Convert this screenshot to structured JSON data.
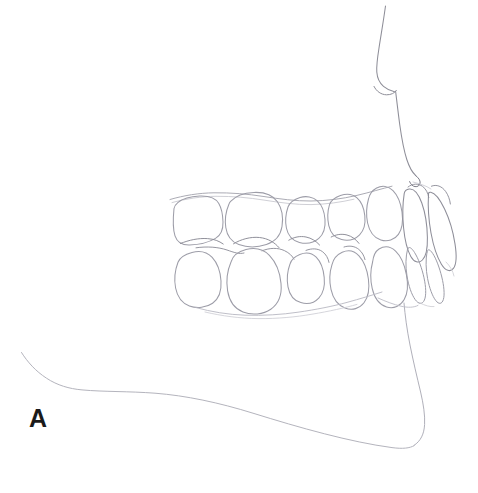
{
  "figure": {
    "panel_label": "A",
    "background_color": "#ffffff",
    "line_color": "#9a9aa2",
    "line_color_dark": "#6e6e78",
    "line_color_faint": "#c2c2ca",
    "label_color": "#1a1a1a"
  },
  "profile": {
    "nose_label": "nose-profile",
    "upper_lip_label": "upper-lip-profile",
    "chin_label": "chin-profile",
    "mandible_label": "mandibular-border-outline"
  },
  "arches": {
    "upper": {
      "name": "maxillary-arch",
      "teeth": [
        "upper-second-molar",
        "upper-first-molar",
        "upper-second-premolar",
        "upper-first-premolar",
        "upper-canine",
        "upper-lateral-incisor",
        "upper-central-incisor"
      ]
    },
    "lower": {
      "name": "mandibular-arch",
      "teeth": [
        "lower-second-molar",
        "lower-first-molar",
        "lower-second-premolar",
        "lower-first-premolar",
        "lower-canine",
        "lower-lateral-incisor",
        "lower-central-incisor"
      ]
    }
  }
}
